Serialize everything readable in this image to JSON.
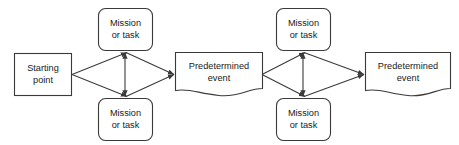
{
  "diagram": {
    "type": "flowchart",
    "title": "",
    "background_color": "#ffffff",
    "stroke_color": "#3a3a3a",
    "text_color": "#1a1a1a",
    "nodes": [
      {
        "id": "start",
        "shape": "rectangle",
        "line1": "Starting",
        "line2": "point"
      },
      {
        "id": "mission-1-top",
        "shape": "rounded-rectangle",
        "line1": "Mission",
        "line2": "or task"
      },
      {
        "id": "mission-1-bottom",
        "shape": "rounded-rectangle",
        "line1": "Mission",
        "line2": "or task"
      },
      {
        "id": "event-1",
        "shape": "document",
        "line1": "Predetermined",
        "line2": "event"
      },
      {
        "id": "mission-2-top",
        "shape": "rounded-rectangle",
        "line1": "Mission",
        "line2": "or task"
      },
      {
        "id": "mission-2-bottom",
        "shape": "rounded-rectangle",
        "line1": "Mission",
        "line2": "or task"
      },
      {
        "id": "event-2",
        "shape": "document",
        "line1": "Predetermined",
        "line2": "event"
      }
    ],
    "edges": [
      {
        "from": "start",
        "to": "mission-1-top",
        "arrow": "single"
      },
      {
        "from": "start",
        "to": "mission-1-bottom",
        "arrow": "single"
      },
      {
        "from": "mission-1-top",
        "to": "mission-1-bottom",
        "arrow": "double"
      },
      {
        "from": "mission-1-top",
        "to": "event-1",
        "arrow": "single"
      },
      {
        "from": "mission-1-bottom",
        "to": "event-1",
        "arrow": "single"
      },
      {
        "from": "event-1",
        "to": "mission-2-top",
        "arrow": "single"
      },
      {
        "from": "event-1",
        "to": "mission-2-bottom",
        "arrow": "single"
      },
      {
        "from": "mission-2-top",
        "to": "mission-2-bottom",
        "arrow": "double"
      },
      {
        "from": "mission-2-top",
        "to": "event-2",
        "arrow": "single"
      },
      {
        "from": "mission-2-bottom",
        "to": "event-2",
        "arrow": "single"
      }
    ]
  }
}
